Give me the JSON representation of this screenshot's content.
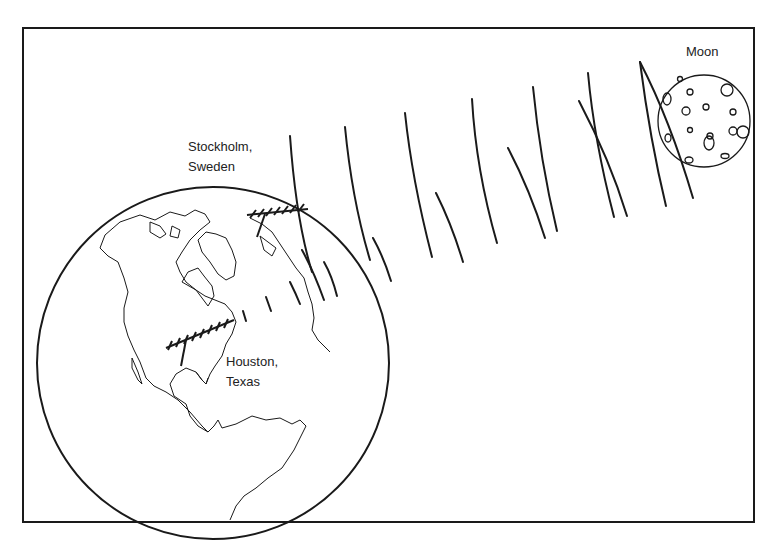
{
  "diagram": {
    "type": "illustration",
    "labels": {
      "stockholm_line1": "Stockholm,",
      "stockholm_line2": "Sweden",
      "houston_line1": "Houston,",
      "houston_line2": "Texas",
      "moon": "Moon"
    },
    "elements": [
      {
        "name": "earth-globe",
        "depicts": "Earth showing the Americas, Greenland and Scandinavia"
      },
      {
        "name": "moon",
        "depicts": "Cratered Moon in upper right"
      },
      {
        "name": "stockholm-antenna",
        "depicts": "Antenna array at Stockholm"
      },
      {
        "name": "houston-antenna",
        "depicts": "Antenna array at Houston"
      },
      {
        "name": "signal-waves",
        "depicts": "Curved wavefronts traveling between Moon and Earth"
      }
    ],
    "colors": {
      "stroke": "#1a1a1a",
      "background": "#ffffff"
    }
  }
}
